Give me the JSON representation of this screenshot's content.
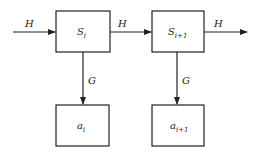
{
  "diagram": {
    "edges": {
      "input_label": "H",
      "between_label": "H",
      "output_label": "H",
      "down_left_label": "G",
      "down_right_label": "G"
    },
    "nodes": {
      "state_i": {
        "base": "S",
        "sub": "i"
      },
      "state_i1": {
        "base": "S",
        "sub": "i+1"
      },
      "out_i": {
        "base": "a",
        "sub": "i"
      },
      "out_i1": {
        "base": "a",
        "sub": "i+1"
      }
    },
    "colors": {
      "stroke": "#222222",
      "background": "#ffffff"
    }
  }
}
